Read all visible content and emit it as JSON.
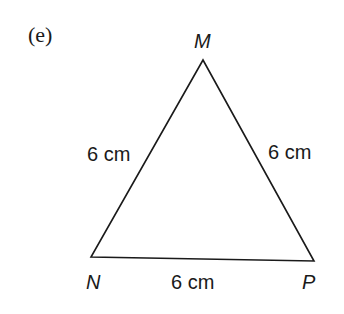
{
  "part_label": "(e)",
  "triangle": {
    "vertices": {
      "M": {
        "label": "M",
        "x": 203,
        "y": 60
      },
      "N": {
        "label": "N",
        "x": 91,
        "y": 257
      },
      "P": {
        "label": "P",
        "x": 314,
        "y": 261
      }
    },
    "sides": {
      "MN": "6 cm",
      "MP": "6 cm",
      "NP": "6 cm"
    },
    "stroke_color": "#1a1a1a"
  }
}
